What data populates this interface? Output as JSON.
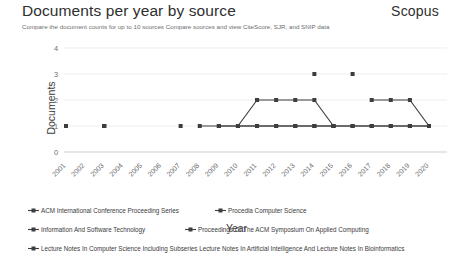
{
  "header": {
    "title": "Documents per year by source",
    "brand": "Scopus",
    "subtitle": "Compare the document counts for up to 10 sources Compare sources and view CiteScore, SJR, and SNIP data"
  },
  "chart_data": {
    "type": "line",
    "title": "Documents per year by source",
    "xlabel": "Year",
    "ylabel": "Documents",
    "categories": [
      "2001",
      "2002",
      "2003",
      "2004",
      "2005",
      "2006",
      "2007",
      "2008",
      "2009",
      "2010",
      "2011",
      "2012",
      "2013",
      "2014",
      "2015",
      "2016",
      "2017",
      "2018",
      "2019",
      "2020"
    ],
    "ylim": [
      0,
      4
    ],
    "yticks": [
      0,
      1,
      2,
      3,
      4
    ],
    "grid": true,
    "legend_position": "bottom",
    "marker": "square",
    "line_color": "#3d3d3d",
    "series": [
      {
        "name": "ACM International Conference Proceeding Series",
        "values": [
          null,
          null,
          null,
          null,
          null,
          null,
          null,
          null,
          null,
          1,
          2,
          2,
          2,
          2,
          1,
          null,
          2,
          2,
          2,
          1
        ]
      },
      {
        "name": "Procedia Computer Science",
        "values": [
          null,
          null,
          null,
          null,
          null,
          null,
          null,
          null,
          null,
          null,
          null,
          null,
          null,
          3,
          null,
          3,
          null,
          null,
          null,
          1
        ]
      },
      {
        "name": "Information And Software Technology",
        "values": [
          1,
          null,
          1,
          null,
          null,
          null,
          null,
          null,
          null,
          null,
          2,
          null,
          null,
          null,
          null,
          null,
          null,
          null,
          null,
          null
        ]
      },
      {
        "name": "Proceedings Of The ACM Symposium On Applied Computing",
        "values": [
          1,
          null,
          1,
          null,
          null,
          null,
          1,
          null,
          1,
          1,
          1,
          1,
          1,
          1,
          1,
          1,
          1,
          1,
          1,
          1
        ]
      },
      {
        "name": "Lecture Notes In Computer Science Including Subseries Lecture Notes In Artificial Intelligence And Lecture Notes In Bioinformatics",
        "values": [
          1,
          null,
          1,
          null,
          null,
          null,
          null,
          1,
          1,
          1,
          1,
          1,
          1,
          1,
          1,
          1,
          1,
          1,
          1,
          1
        ]
      }
    ]
  },
  "legend": {
    "items": [
      {
        "label": "ACM International Conference Proceeding Series"
      },
      {
        "label": "Procedia Computer Science"
      },
      {
        "label": "Information And Software Technology"
      },
      {
        "label": "Proceedings Of The ACM Symposium On Applied Computing"
      },
      {
        "label": "Lecture Notes In Computer Science Including Subseries Lecture Notes In Artificial Intelligence And Lecture Notes In Bioinformatics"
      }
    ]
  }
}
